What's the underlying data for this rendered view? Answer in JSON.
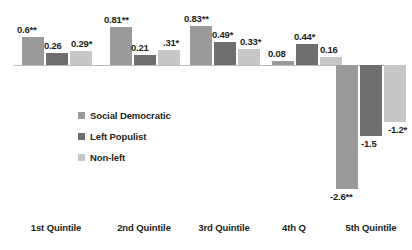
{
  "chart_data": {
    "type": "bar",
    "title": "",
    "subtitle": "",
    "xlabel": "",
    "ylabel": "",
    "categories": [
      "1st Quintile",
      "2nd Quintile",
      "3rd Quintile",
      "4th Q",
      "5th Quintile"
    ],
    "series": [
      {
        "name": "Social Democratic",
        "color": "#9a9a9a",
        "values": [
          0.6,
          0.81,
          0.83,
          0.08,
          -2.6
        ],
        "labels": [
          "0.6**",
          "0.81**",
          "0.83**",
          "0.08",
          "-2.6**"
        ]
      },
      {
        "name": "Left Populist",
        "color": "#6e6e6e",
        "values": [
          0.26,
          0.21,
          0.49,
          0.44,
          -1.5
        ],
        "labels": [
          "0.26",
          "0.21",
          "0.49*",
          "0.44*",
          "-1.5"
        ]
      },
      {
        "name": "Non-left",
        "color": "#c7c7c7",
        "values": [
          0.29,
          0.31,
          0.33,
          0.16,
          -1.2
        ],
        "labels": [
          "0.29*",
          ".31*",
          "0.33*",
          "0.16",
          "-1.2*"
        ]
      }
    ],
    "ylim": [
      -2.9,
      1.0
    ],
    "grid": false,
    "zero_line": true,
    "legend_position": "inside-lower-left",
    "axis_color": "#b9b9b9"
  },
  "legend": {
    "items": [
      {
        "label": "Social Democratic",
        "color": "#9a9a9a"
      },
      {
        "label": "Left Populist",
        "color": "#6e6e6e"
      },
      {
        "label": "Non-left",
        "color": "#c7c7c7"
      }
    ]
  }
}
